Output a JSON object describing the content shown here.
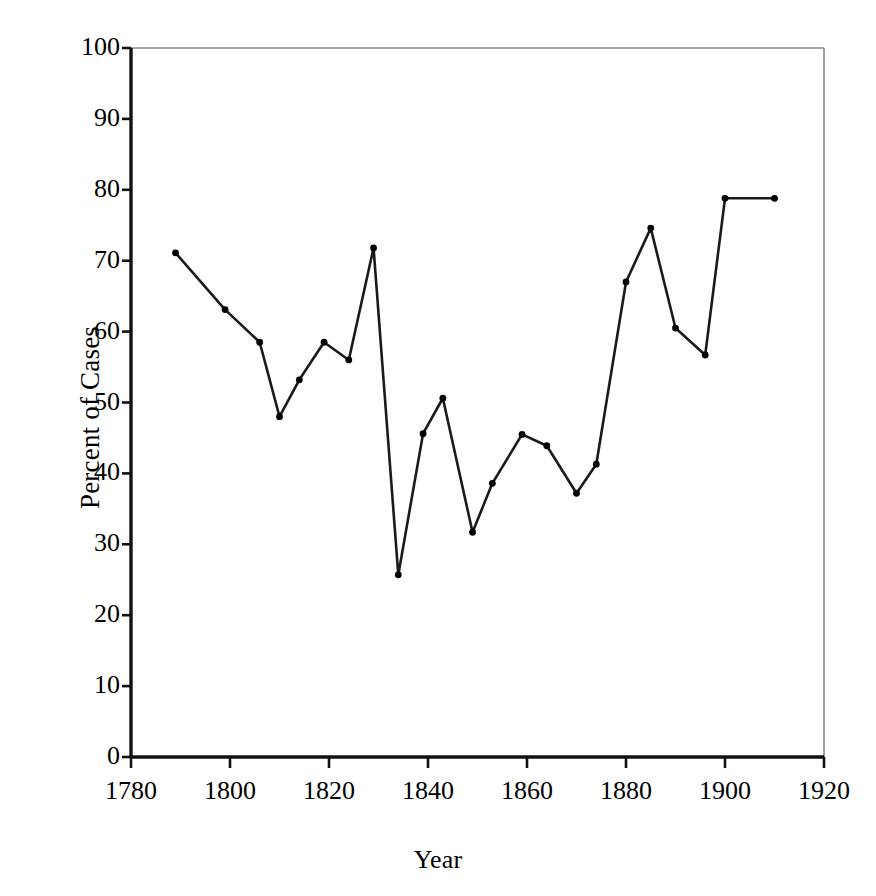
{
  "chart_data": {
    "type": "line",
    "title": "",
    "xlabel": "Year",
    "ylabel": "Percent of Cases",
    "xlim": [
      1780,
      1920
    ],
    "ylim": [
      0,
      100
    ],
    "xticks": [
      1780,
      1800,
      1820,
      1840,
      1860,
      1880,
      1900,
      1920
    ],
    "xtick_labels": [
      "1780",
      "1800",
      "1820",
      "1840",
      "1860",
      "1880",
      "1900",
      "1920"
    ],
    "yticks": [
      0,
      10,
      20,
      30,
      40,
      50,
      60,
      70,
      80,
      90,
      100
    ],
    "ytick_labels": [
      "0",
      "10",
      "20",
      "30",
      "40",
      "50",
      "60",
      "70",
      "80",
      "90",
      "100"
    ],
    "grid": false,
    "legend": null,
    "marker": "filled-circle",
    "line_color": "#1a1a1a",
    "marker_color": "#000000",
    "series": [
      {
        "name": "Percent of Cases",
        "x": [
          1789,
          1799,
          1806,
          1810,
          1814,
          1819,
          1824,
          1829,
          1834,
          1839,
          1843,
          1849,
          1853,
          1859,
          1864,
          1870,
          1874,
          1880,
          1885,
          1890,
          1896,
          1900,
          1910
        ],
        "values": [
          71.1,
          63.1,
          58.5,
          48.0,
          53.2,
          58.5,
          56.0,
          71.8,
          25.7,
          45.6,
          50.6,
          31.7,
          38.6,
          45.5,
          43.9,
          37.2,
          41.3,
          67.0,
          74.6,
          60.5,
          56.7,
          78.8,
          78.8
        ]
      }
    ]
  },
  "axes": {
    "left_axis_color": "#111111",
    "bottom_axis_color": "#111111",
    "frame_color": "#8a8a8a"
  }
}
